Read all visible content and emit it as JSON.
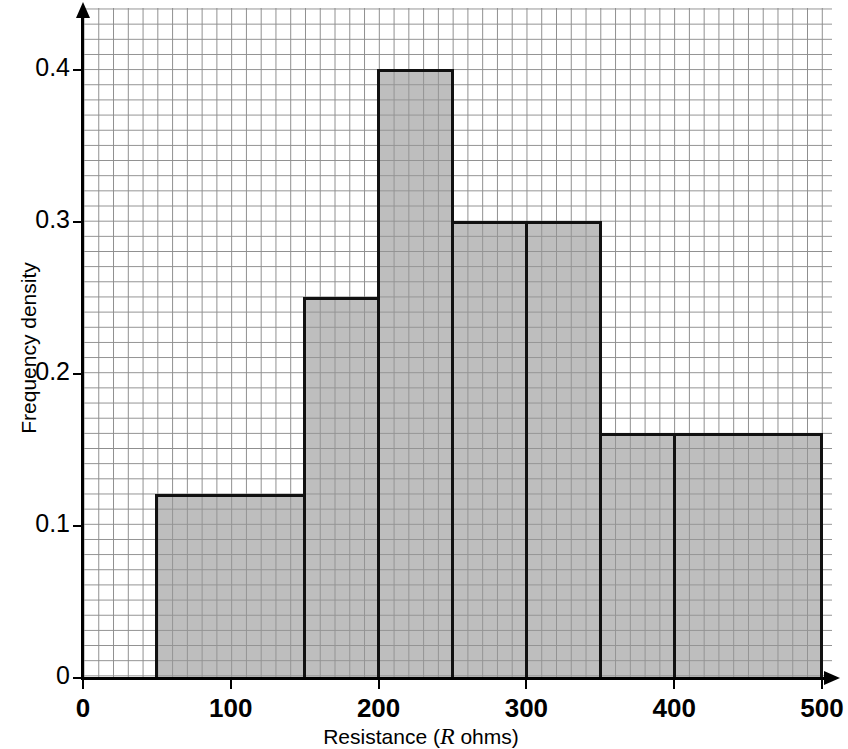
{
  "chart_data": {
    "type": "bar",
    "title": "",
    "subtitle": "",
    "xlabel": "Resistance (R ohms)",
    "xlabel_plain": "Resistance (",
    "xlabel_var": "R",
    "xlabel_tail": " ohms)",
    "ylabel": "Frequency density",
    "xlim": [
      0,
      500
    ],
    "ylim": [
      0,
      0.45
    ],
    "grid": true,
    "grid_style": "graph-paper",
    "legend": "none",
    "xticks": [
      0,
      100,
      200,
      300,
      400,
      500
    ],
    "xtick_labels": [
      "0",
      "100",
      "200",
      "300",
      "400",
      "500"
    ],
    "yticks": [
      0,
      0.1,
      0.2,
      0.3,
      0.4
    ],
    "ytick_labels": [
      "0",
      "0.1",
      "0.2",
      "0.3",
      "0.4"
    ],
    "bin_edges": [
      50,
      150,
      200,
      250,
      300,
      350,
      400,
      500
    ],
    "categories": [
      "50-150",
      "150-200",
      "200-250",
      "250-300",
      "300-350",
      "350-400",
      "400-500"
    ],
    "values": [
      0.12,
      0.25,
      0.4,
      0.3,
      0.3,
      0.16,
      0.16
    ],
    "bar_fill_color": "#969696",
    "bar_edge_color": "#111111",
    "grid_line_color": "#8e8e8e",
    "axis_color": "#000000",
    "background_color": "#ffffff"
  },
  "axes": {
    "x": {
      "title_prefix": "Resistance (",
      "title_variable": "R",
      "title_suffix": " ohms)",
      "ticks": [
        {
          "label": "0",
          "value": 0
        },
        {
          "label": "100",
          "value": 100
        },
        {
          "label": "200",
          "value": 200
        },
        {
          "label": "300",
          "value": 300
        },
        {
          "label": "400",
          "value": 400
        },
        {
          "label": "500",
          "value": 500
        }
      ]
    },
    "y": {
      "title": "Frequency density",
      "ticks": [
        {
          "label": "0",
          "value": 0
        },
        {
          "label": "0.1",
          "value": 0.1
        },
        {
          "label": "0.2",
          "value": 0.2
        },
        {
          "label": "0.3",
          "value": 0.3
        },
        {
          "label": "0.4",
          "value": 0.4
        }
      ]
    }
  }
}
